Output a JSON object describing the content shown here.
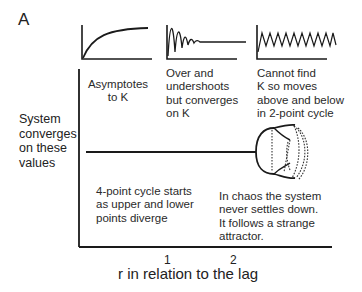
{
  "panel": {
    "label": "A"
  },
  "insets": [
    {
      "id": "asymptote",
      "caption_lines": [
        "Asymptotes",
        "to K"
      ]
    },
    {
      "id": "damped-oscillation",
      "caption_lines": [
        "Over and",
        "undershoots",
        "but converges",
        "on K"
      ]
    },
    {
      "id": "two-point-cycle",
      "caption_lines": [
        "Cannot find",
        "K so moves",
        "above and below",
        "in 2-point cycle"
      ]
    }
  ],
  "axes": {
    "ylabel_lines": [
      "System",
      "converges",
      "on these",
      "values"
    ],
    "xlabel": "r in relation to the lag",
    "xticks": [
      "1",
      "2"
    ]
  },
  "annotations": {
    "four_point": [
      "4-point cycle starts",
      "as upper and lower",
      "points diverge"
    ],
    "chaos": [
      "In chaos the system",
      "never settles down.",
      "It follows a strange",
      "attractor."
    ]
  },
  "colors": {
    "line": "#1a1a1a",
    "text": "#2a2a2a",
    "background": "#ffffff"
  }
}
